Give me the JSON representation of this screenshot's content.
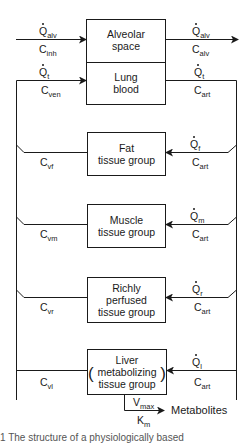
{
  "caption_top_cut": "",
  "caption_bottom_cut": "1  The structure of a physiologically based",
  "compartments": {
    "alveolar": {
      "line1": "Alveolar",
      "line2": "space"
    },
    "lung": {
      "line1": "Lung",
      "line2": "blood"
    },
    "fat": {
      "line1": "Fat",
      "line2": "tissue group"
    },
    "muscle": {
      "line1": "Muscle",
      "line2": "tissue group"
    },
    "richly": {
      "line1": "Richly",
      "line2": "perfused",
      "line3": "tissue group"
    },
    "liver": {
      "line1": "Liver",
      "line2": "metabolizing",
      "line3": "tissue group",
      "paren_open": "(",
      "paren_close": ")"
    }
  },
  "labels": {
    "q": "Q",
    "c": "C",
    "v": "V",
    "k": "K",
    "alv": "alv",
    "inh": "inh",
    "t": "t",
    "ven": "ven",
    "art": "art",
    "f": "f",
    "vf": "vf",
    "m": "m",
    "vm": "vm",
    "r": "r",
    "vr": "vr",
    "l": "l",
    "vl": "vl",
    "max": "max",
    "km_sub": "m",
    "metabolites": "Metabolites"
  }
}
